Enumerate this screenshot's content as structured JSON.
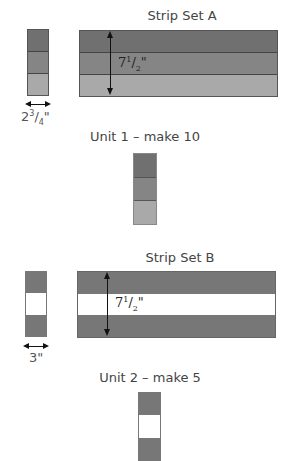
{
  "colors": {
    "dark": "#707070",
    "medium": "#858585",
    "light": "#a9a9a9",
    "white": "#ffffff",
    "outline": "#555555"
  },
  "strip_set_a": {
    "title": "Strip Set A",
    "height_label": "7½\"",
    "height_whole": "7",
    "height_frac_num": "1",
    "height_frac_den": "2",
    "cut_width_label": "2¾\"",
    "cut_whole": "2",
    "cut_frac_num": "3",
    "cut_frac_den": "4",
    "segments": [
      "dark",
      "medium",
      "light"
    ]
  },
  "unit_1": {
    "title": "Unit 1 – make 10",
    "segments": [
      "dark",
      "medium",
      "light"
    ]
  },
  "strip_set_b": {
    "title": "Strip Set B",
    "height_label": "7½\"",
    "height_whole": "7",
    "height_frac_num": "1",
    "height_frac_den": "2",
    "cut_width_label": "3\"",
    "segments": [
      "dark",
      "white",
      "dark"
    ]
  },
  "unit_2": {
    "title": "Unit 2 – make 5",
    "segments": [
      "dark",
      "white",
      "dark"
    ]
  }
}
